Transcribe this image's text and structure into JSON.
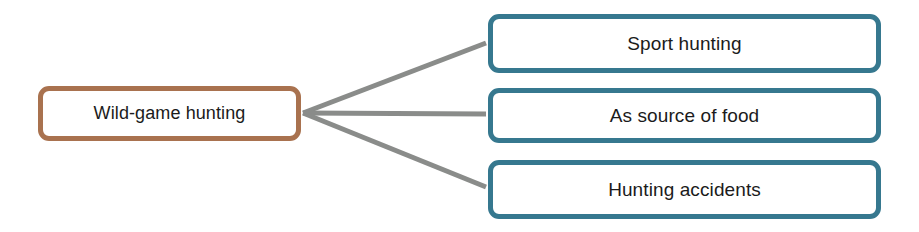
{
  "diagram": {
    "type": "mind-map",
    "orientation": "left-to-right",
    "background_color": "#ffffff",
    "canvas": {
      "width": 919,
      "height": 232
    },
    "root": {
      "label": "Wild-game hunting",
      "border_color": "#a9724f",
      "fill_color": "#ffffff",
      "text_color": "#1b1b1b"
    },
    "connector": {
      "color": "#8a8c8a",
      "width": 5,
      "junction": {
        "x": 303,
        "y": 113
      }
    },
    "children": [
      {
        "label": "Sport hunting",
        "border_color": "#36788f",
        "fill_color": "#ffffff",
        "text_color": "#1b1b1b"
      },
      {
        "label": "As source of food",
        "border_color": "#36788f",
        "fill_color": "#ffffff",
        "text_color": "#1b1b1b"
      },
      {
        "label": "Hunting accidents",
        "border_color": "#36788f",
        "fill_color": "#ffffff",
        "text_color": "#1b1b1b"
      }
    ]
  }
}
